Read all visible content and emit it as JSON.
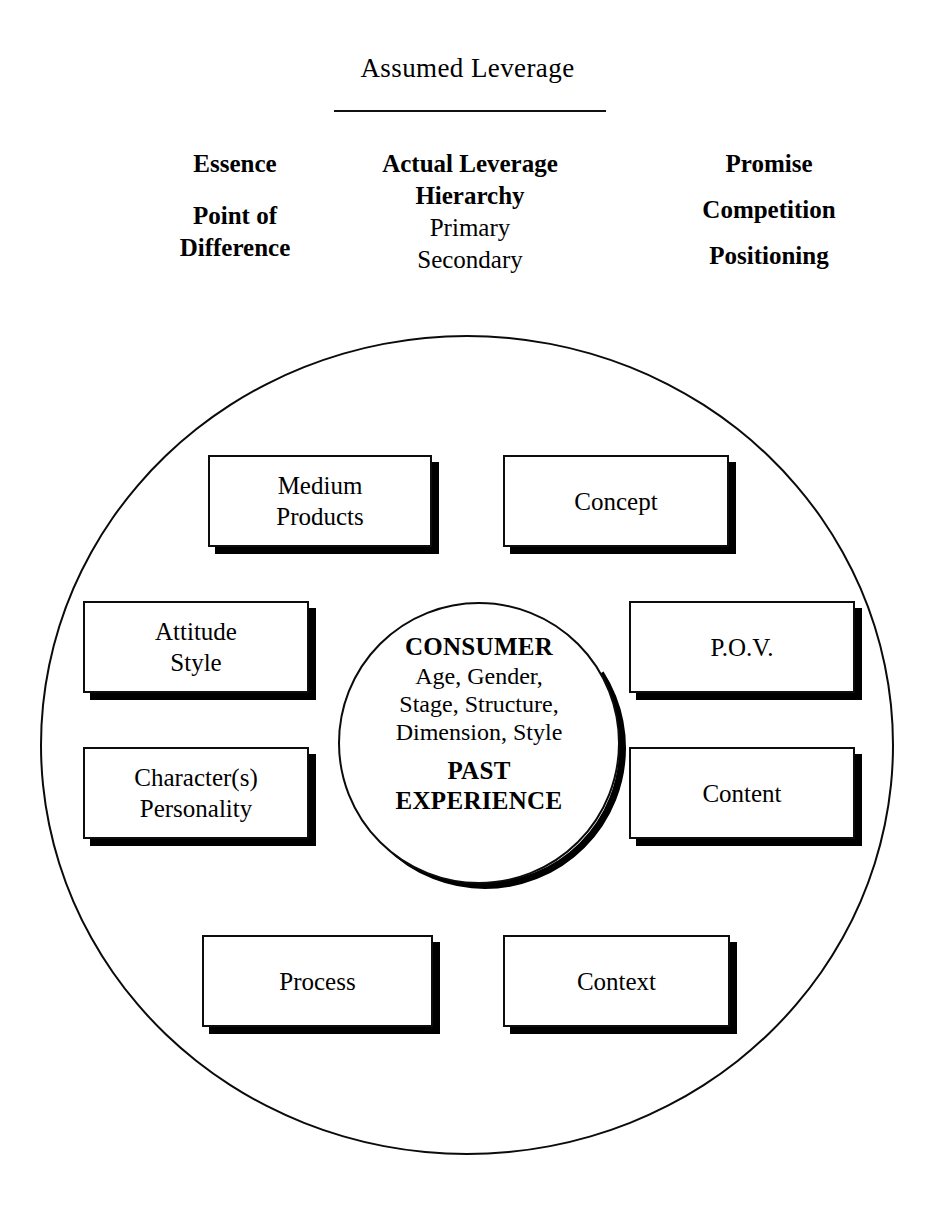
{
  "header": {
    "title": "Assumed Leverage",
    "rule": "horizontal-rule",
    "columns": {
      "left": [
        {
          "text": "Essence",
          "weight": "bold"
        },
        {
          "text": "Point of\nDifference",
          "weight": "bold"
        }
      ],
      "center": [
        {
          "text": "Actual Leverage\nHierarchy",
          "weight": "bold"
        },
        {
          "text": "Primary",
          "weight": "regular"
        },
        {
          "text": "Secondary",
          "weight": "regular"
        }
      ],
      "right": [
        {
          "text": "Promise",
          "weight": "bold"
        },
        {
          "text": "Competition",
          "weight": "bold"
        },
        {
          "text": "Positioning",
          "weight": "bold"
        }
      ]
    }
  },
  "diagram": {
    "outer_circle": "outer-boundary-circle",
    "inner_circle": {
      "heading": "CONSUMER",
      "body": "Age, Gender,\nStage, Structure,\nDimension, Style",
      "footer": "PAST\nEXPERIENCE"
    },
    "boxes": [
      {
        "id": "medium-products",
        "label": "Medium\nProducts"
      },
      {
        "id": "concept",
        "label": "Concept"
      },
      {
        "id": "attitude-style",
        "label": "Attitude\nStyle"
      },
      {
        "id": "pov",
        "label": "P.O.V."
      },
      {
        "id": "character",
        "label": "Character(s)\nPersonality"
      },
      {
        "id": "content",
        "label": "Content"
      },
      {
        "id": "process",
        "label": "Process"
      },
      {
        "id": "context",
        "label": "Context"
      }
    ]
  },
  "colors": {
    "ink": "#000000",
    "background": "#ffffff",
    "stroke": "#0d0d0d"
  }
}
